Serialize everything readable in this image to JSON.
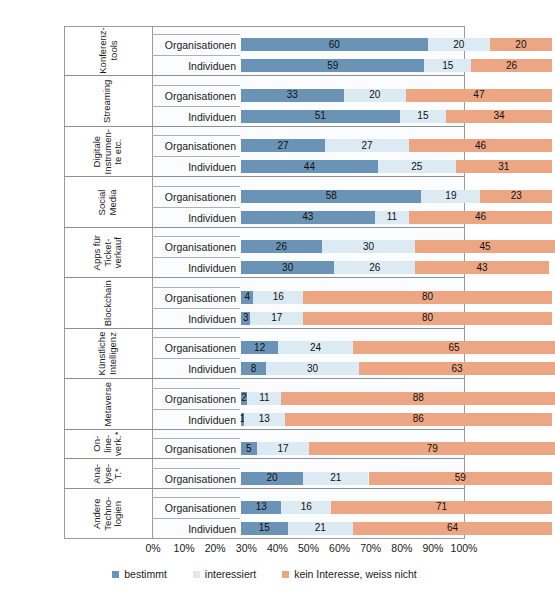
{
  "top_partial_text": "",
  "legend": {
    "position": "bottom",
    "items": [
      {
        "label": "bestimmt",
        "color": "#6b93b5"
      },
      {
        "label": "interessiert",
        "color": "#dceaf4"
      },
      {
        "label": "kein Interesse, weiss nicht",
        "color": "#eda683"
      }
    ]
  },
  "axis": {
    "ticks": [
      "0%",
      "10%",
      "20%",
      "30%",
      "40%",
      "50%",
      "60%",
      "70%",
      "80%",
      "90%",
      "100%"
    ],
    "min": 0,
    "max": 100
  },
  "chart_data": {
    "type": "bar",
    "orientation": "horizontal",
    "stacked": true,
    "stack_total": 100,
    "title": "",
    "subtitle": "",
    "xlabel": "",
    "ylabel": "",
    "xlim": [
      0,
      100
    ],
    "grid": false,
    "legend_position": "bottom",
    "series": [
      {
        "name": "bestimmt",
        "color": "#6b93b5"
      },
      {
        "name": "interessiert",
        "color": "#dceaf4"
      },
      {
        "name": "kein Interesse, weiss nicht",
        "color": "#eda683"
      }
    ],
    "groups": [
      {
        "label_lines": [
          "Konferenz-",
          "tools"
        ],
        "rows": [
          {
            "name": "Organisationen",
            "values": [
              60,
              20,
              20
            ]
          },
          {
            "name": "Individuen",
            "values": [
              59,
              15,
              26
            ]
          }
        ]
      },
      {
        "label_lines": [
          "Streaming"
        ],
        "rows": [
          {
            "name": "Organisationen",
            "values": [
              33,
              20,
              47
            ]
          },
          {
            "name": "Individuen",
            "values": [
              51,
              15,
              34
            ]
          }
        ]
      },
      {
        "label_lines": [
          "Digitale",
          "Instrumen-",
          "te etc."
        ],
        "rows": [
          {
            "name": "Organisationen",
            "values": [
              27,
              27,
              46
            ]
          },
          {
            "name": "Individuen",
            "values": [
              44,
              25,
              31
            ]
          }
        ]
      },
      {
        "label_lines": [
          "Social",
          "Media"
        ],
        "rows": [
          {
            "name": "Organisationen",
            "values": [
              58,
              19,
              23
            ]
          },
          {
            "name": "Individuen",
            "values": [
              43,
              11,
              46
            ]
          }
        ]
      },
      {
        "label_lines": [
          "Apps für",
          "Ticket-",
          "verkauf"
        ],
        "rows": [
          {
            "name": "Organisationen",
            "values": [
              26,
              30,
              45
            ]
          },
          {
            "name": "Individuen",
            "values": [
              30,
              26,
              43
            ]
          }
        ]
      },
      {
        "label_lines": [
          "Blockchain"
        ],
        "rows": [
          {
            "name": "Organisationen",
            "values": [
              4,
              16,
              80
            ]
          },
          {
            "name": "Individuen",
            "values": [
              3,
              17,
              80
            ]
          }
        ]
      },
      {
        "label_lines": [
          "Künstliche",
          "Intelligenz"
        ],
        "rows": [
          {
            "name": "Organisationen",
            "values": [
              12,
              24,
              65
            ]
          },
          {
            "name": "Individuen",
            "values": [
              8,
              30,
              63
            ]
          }
        ]
      },
      {
        "label_lines": [
          "Metaverse"
        ],
        "rows": [
          {
            "name": "Organisationen",
            "values": [
              2,
              11,
              88
            ]
          },
          {
            "name": "Individuen",
            "values": [
              1,
              13,
              86
            ]
          }
        ]
      },
      {
        "label_lines": [
          "On-",
          "line-",
          "verk.*"
        ],
        "rows": [
          {
            "name": "Organisationen",
            "values": [
              5,
              17,
              79
            ]
          }
        ]
      },
      {
        "label_lines": [
          "Ana-",
          "lyse-",
          "T.*"
        ],
        "rows": [
          {
            "name": "Organisationen",
            "values": [
              20,
              21,
              59
            ]
          }
        ]
      },
      {
        "label_lines": [
          "Andere",
          "Techno-",
          "logien"
        ],
        "rows": [
          {
            "name": "Organisationen",
            "values": [
              13,
              16,
              71
            ]
          },
          {
            "name": "Individuen",
            "values": [
              15,
              21,
              64
            ]
          }
        ]
      }
    ]
  }
}
